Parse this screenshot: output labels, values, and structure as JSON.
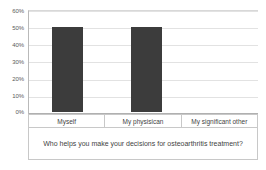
{
  "chart_data": {
    "type": "bar",
    "title": "",
    "xlabel": "Who helps you make your decisions for osteoarthritis treatment?",
    "ylabel": "",
    "categories": [
      "Myself",
      "My physisican",
      "My significant other"
    ],
    "values": [
      50,
      50,
      0
    ],
    "value_unit": "%",
    "ylim": [
      0,
      60
    ],
    "ytick_labels": [
      "60%",
      "50%",
      "40%",
      "30%",
      "20%",
      "10%",
      "0%"
    ],
    "ytick_values": [
      60,
      50,
      40,
      30,
      20,
      10,
      0
    ],
    "grid": true,
    "legend": false,
    "legend_position": "none",
    "series": [
      {
        "name": "Response share",
        "values": [
          50,
          50,
          0
        ],
        "color": "#3c3c3c"
      }
    ]
  },
  "style": {
    "bar_color": "#3c3c3c",
    "gridline_color": "#e2e2e2",
    "axis_color": "#b0b0b0",
    "table_border_color": "#c8c8c8",
    "text_color": "#3f3f3f",
    "background": "#ffffff"
  }
}
